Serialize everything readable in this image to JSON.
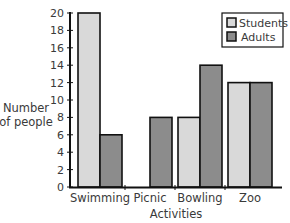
{
  "chart_data": {
    "type": "bar",
    "title": "",
    "xlabel": "Activities",
    "ylabel": "Number of people",
    "ylabel_lines": [
      "Number",
      "of people"
    ],
    "categories": [
      "Swimming",
      "Picnic",
      "Bowling",
      "Zoo"
    ],
    "series": [
      {
        "name": "Students",
        "values": [
          20,
          0,
          8,
          12
        ],
        "color": "#d9d9d9"
      },
      {
        "name": "Adults",
        "values": [
          6,
          8,
          14,
          12
        ],
        "color": "#8c8c8c"
      }
    ],
    "ylim": [
      0,
      20
    ],
    "yticks": [
      0,
      2,
      4,
      6,
      8,
      10,
      12,
      14,
      16,
      18,
      20
    ],
    "grid": false,
    "legend_position": "top-right"
  }
}
